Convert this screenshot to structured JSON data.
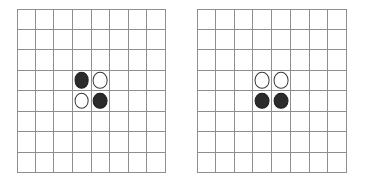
{
  "figure": {
    "background_color": "#ffffff",
    "board_count": 2
  },
  "colors": {
    "grid_line": "#8e8e8e",
    "black_stone": "#2b2b2b",
    "black_stone_edge": "#1d1d1d",
    "white_stone": "#ffffff",
    "white_stone_edge": "#3a3a3a",
    "board_background": "#ffffff"
  },
  "boards": [
    {
      "name": "left-board",
      "rows": 8,
      "cols": 8,
      "x": 17,
      "y": 9,
      "width": 149,
      "height": 164,
      "stones": [
        {
          "row": 4,
          "col": 4,
          "color": "black"
        },
        {
          "row": 4,
          "col": 5,
          "color": "white"
        },
        {
          "row": 5,
          "col": 4,
          "color": "white"
        },
        {
          "row": 5,
          "col": 5,
          "color": "black"
        }
      ]
    },
    {
      "name": "right-board",
      "rows": 8,
      "cols": 8,
      "x": 197,
      "y": 9,
      "width": 150,
      "height": 164,
      "stones": [
        {
          "row": 4,
          "col": 4,
          "color": "white"
        },
        {
          "row": 4,
          "col": 5,
          "color": "white"
        },
        {
          "row": 5,
          "col": 4,
          "color": "black"
        },
        {
          "row": 5,
          "col": 5,
          "color": "black"
        }
      ]
    }
  ]
}
